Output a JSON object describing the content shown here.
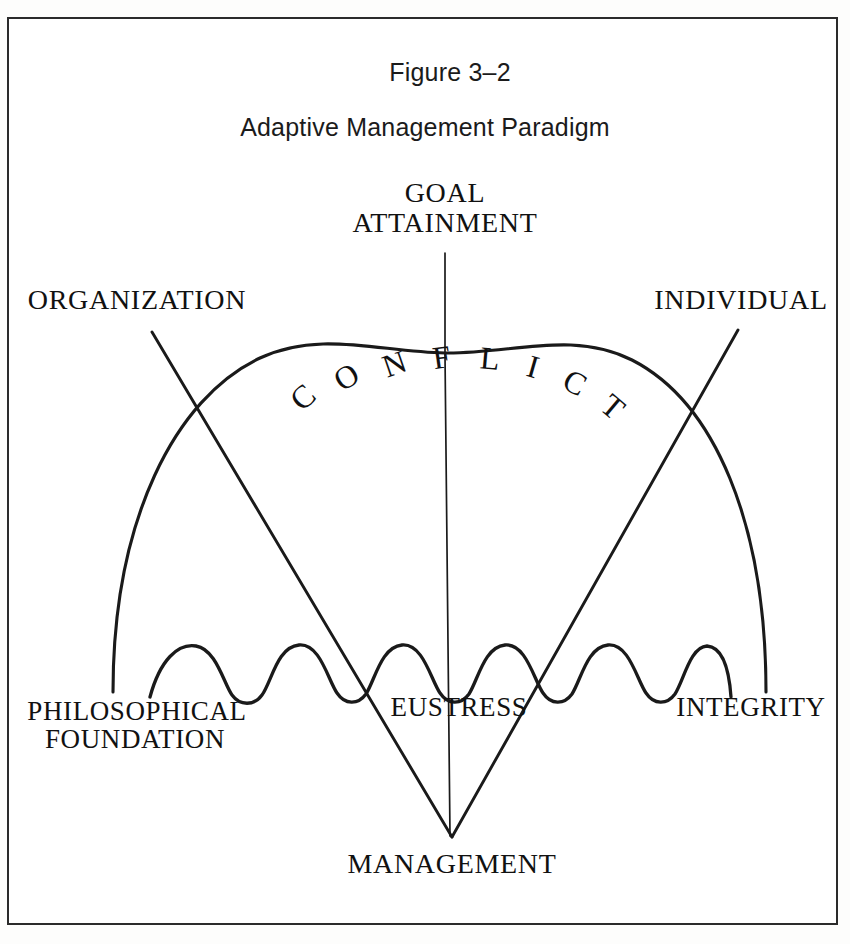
{
  "figure": {
    "number_label": "Figure 3–2",
    "title": "Adaptive Management Paradigm"
  },
  "labels": {
    "apex_line1": "GOAL",
    "apex_line2": "ATTAINMENT",
    "left_top": "ORGANIZATION",
    "right_top": "INDIVIDUAL",
    "arc_text": "CONFLICT",
    "bottom_left_line1": "PHILOSOPHICAL",
    "bottom_left_line2": "FOUNDATION",
    "bottom_center": "EUSTRESS",
    "bottom_right": "INTEGRITY",
    "bottom_apex": "MANAGEMENT"
  },
  "arc_letters": [
    {
      "char": "C",
      "x": 310,
      "y": 405,
      "rotate": -42
    },
    {
      "char": "O",
      "x": 352,
      "y": 386,
      "rotate": -31
    },
    {
      "char": "N",
      "x": 398,
      "y": 374,
      "rotate": -19
    },
    {
      "char": "F",
      "x": 443,
      "y": 368,
      "rotate": -8
    },
    {
      "char": "L",
      "x": 489,
      "y": 369,
      "rotate": 5
    },
    {
      "char": "I",
      "x": 530,
      "y": 377,
      "rotate": 16
    },
    {
      "char": "C",
      "x": 570,
      "y": 392,
      "rotate": 28
    },
    {
      "char": "T",
      "x": 606,
      "y": 415,
      "rotate": 40
    }
  ],
  "colors": {
    "ink": "#1a1a1a",
    "page": "#ffffff",
    "frame": "#2b2b2b"
  },
  "geometry": {
    "arc_left_end": "113,692",
    "arc_right_end": "766,692",
    "arc_apex": "445,353",
    "v_apex": "452,838",
    "wave_left": "150,665",
    "wave_right": "731,665"
  }
}
